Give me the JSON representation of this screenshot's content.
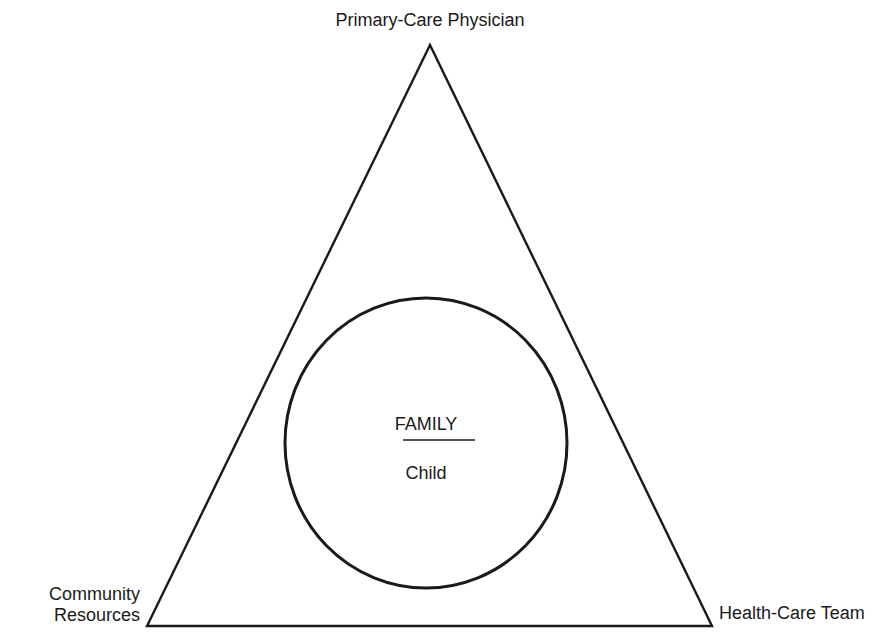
{
  "diagram": {
    "vertices": {
      "top": "Primary-Care Physician",
      "bottom_left_line1": "Community",
      "bottom_left_line2": "Resources",
      "bottom_right": "Health-Care Team"
    },
    "center": {
      "title": "FAMILY",
      "subtitle": "Child"
    },
    "colors": {
      "stroke": "#1a1a1a",
      "background": "#ffffff"
    },
    "shapes": {
      "triangle": {
        "apex": [
          430,
          45
        ],
        "bottom_left": [
          147,
          626
        ],
        "bottom_right": [
          712,
          626
        ]
      },
      "circle": {
        "cx": 426,
        "cy": 443,
        "rx": 141,
        "ry": 145
      }
    }
  }
}
